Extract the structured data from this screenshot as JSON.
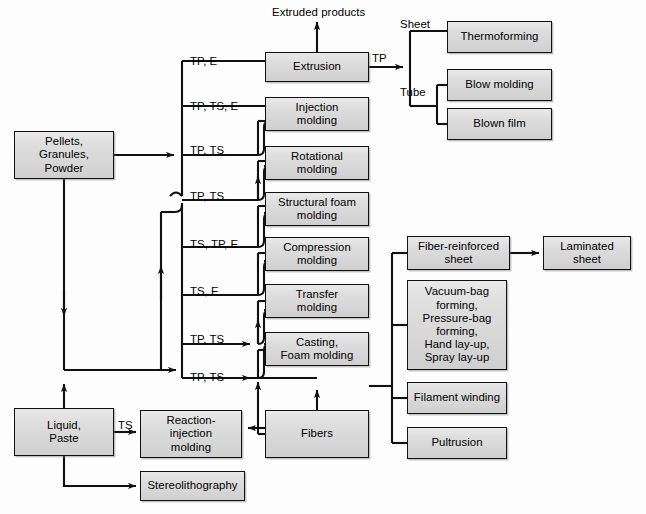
{
  "diagram": {
    "background_color": "#fdfdfd",
    "box_fill_color": "#d9d9d9",
    "line_color": "#111111"
  },
  "nodes": [
    {
      "id": "pellets",
      "label": "Pellets,\nGranules,\nPowder",
      "x": 14,
      "y": 131,
      "w": 100,
      "h": 48
    },
    {
      "id": "liquid",
      "label": "Liquid,\nPaste",
      "x": 14,
      "y": 408,
      "w": 100,
      "h": 48
    },
    {
      "id": "stereo",
      "label": "Stereolithography",
      "x": 140,
      "y": 471,
      "w": 105,
      "h": 30
    },
    {
      "id": "rim",
      "label": "Reaction-\ninjection\nmolding",
      "x": 140,
      "y": 410,
      "w": 102,
      "h": 48
    },
    {
      "id": "extrusion",
      "label": "Extrusion",
      "x": 265,
      "y": 52,
      "w": 104,
      "h": 30
    },
    {
      "id": "injection",
      "label": "Injection\nmolding",
      "x": 265,
      "y": 97,
      "w": 104,
      "h": 34
    },
    {
      "id": "rotational",
      "label": "Rotational\nmolding",
      "x": 265,
      "y": 146,
      "w": 104,
      "h": 34
    },
    {
      "id": "structfoam",
      "label": "Structural foam\nmolding",
      "x": 265,
      "y": 192,
      "w": 104,
      "h": 34
    },
    {
      "id": "compression",
      "label": "Compression\nmolding",
      "x": 265,
      "y": 237,
      "w": 104,
      "h": 34
    },
    {
      "id": "transfer",
      "label": "Transfer\nmolding",
      "x": 265,
      "y": 284,
      "w": 104,
      "h": 34
    },
    {
      "id": "casting",
      "label": "Casting,\nFoam molding",
      "x": 265,
      "y": 332,
      "w": 104,
      "h": 34
    },
    {
      "id": "fibers",
      "label": "Fibers",
      "x": 265,
      "y": 410,
      "w": 104,
      "h": 48
    },
    {
      "id": "thermoforming",
      "label": "Thermoforming",
      "x": 447,
      "y": 21,
      "w": 105,
      "h": 32
    },
    {
      "id": "blowmolding",
      "label": "Blow molding",
      "x": 447,
      "y": 69,
      "w": 105,
      "h": 32
    },
    {
      "id": "blownfilm",
      "label": "Blown film",
      "x": 447,
      "y": 108,
      "w": 105,
      "h": 32
    },
    {
      "id": "fiberreinf",
      "label": "Fiber-reinforced\nsheet",
      "x": 407,
      "y": 236,
      "w": 103,
      "h": 34
    },
    {
      "id": "laminated",
      "label": "Laminated\nsheet",
      "x": 543,
      "y": 236,
      "w": 88,
      "h": 34
    },
    {
      "id": "vacuumbag",
      "label": "Vacuum-bag\nforming,\nPressure-bag\nforming,\nHand lay-up,\nSpray lay-up",
      "x": 407,
      "y": 280,
      "w": 100,
      "h": 90
    },
    {
      "id": "filament",
      "label": "Filament winding",
      "x": 407,
      "y": 382,
      "w": 100,
      "h": 32
    },
    {
      "id": "pultrusion",
      "label": "Pultrusion",
      "x": 407,
      "y": 427,
      "w": 100,
      "h": 32
    }
  ],
  "labels": [
    {
      "id": "extruded-products",
      "text": "Extruded products",
      "x": 272,
      "y": 6,
      "align": "left"
    },
    {
      "id": "tp-e",
      "text": "TP, E",
      "x": 190,
      "y": 55,
      "align": "left"
    },
    {
      "id": "tp-ts-e",
      "text": "TP, TS, E",
      "x": 190,
      "y": 100,
      "align": "left"
    },
    {
      "id": "tp-ts-rot",
      "text": "TP, TS",
      "x": 190,
      "y": 144,
      "align": "left"
    },
    {
      "id": "tp-ts-sf",
      "text": "TP, TS",
      "x": 190,
      "y": 190,
      "align": "left"
    },
    {
      "id": "ts-tp-e",
      "text": "TS, TP, E",
      "x": 190,
      "y": 238,
      "align": "left"
    },
    {
      "id": "ts-e",
      "text": "TS, E",
      "x": 190,
      "y": 285,
      "align": "left"
    },
    {
      "id": "tp-ts-cast",
      "text": "TP, TS",
      "x": 190,
      "y": 333,
      "align": "left"
    },
    {
      "id": "tp-ts-fib",
      "text": "TP, TS",
      "x": 190,
      "y": 371,
      "align": "left"
    },
    {
      "id": "ts-rim",
      "text": "TS",
      "x": 118,
      "y": 419,
      "align": "left"
    },
    {
      "id": "tp-extrude-out",
      "text": "TP",
      "x": 372,
      "y": 52,
      "align": "left"
    },
    {
      "id": "sheet",
      "text": "Sheet",
      "x": 400,
      "y": 18,
      "align": "left"
    },
    {
      "id": "tube",
      "text": "Tube",
      "x": 400,
      "y": 86,
      "align": "left"
    }
  ],
  "connections": {
    "description": "Material sources feed a vertical bus that distributes to shaping processes; outputs at right.",
    "branch_labels_column_x": 190,
    "bus_x": 182,
    "fiber_bus_x": 392
  }
}
